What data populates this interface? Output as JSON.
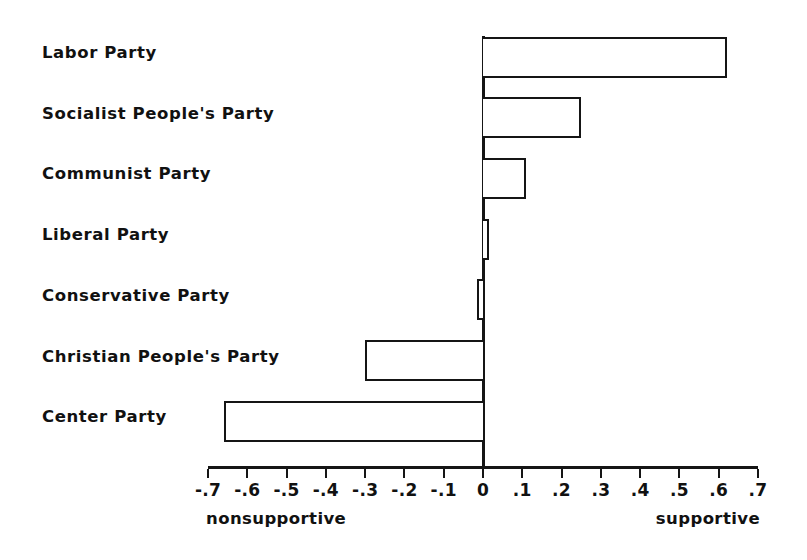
{
  "chart_data": {
    "type": "bar",
    "orientation": "horizontal",
    "title": "",
    "subtitle": "",
    "xlabel": "",
    "ylabel": "",
    "grid": false,
    "legend": null,
    "xlim": [
      -0.7,
      0.7
    ],
    "categories": [
      "Labor Party",
      "Socialist People's Party",
      "Communist Party",
      "Liberal Party",
      "Conservative Party",
      "Christian People's Party",
      "Center Party"
    ],
    "values": [
      0.62,
      0.25,
      0.11,
      0.015,
      -0.015,
      -0.3,
      -0.66
    ],
    "tick_values": [
      -0.7,
      -0.6,
      -0.5,
      -0.4,
      -0.3,
      -0.2,
      -0.1,
      0,
      0.1,
      0.2,
      0.3,
      0.4,
      0.5,
      0.6,
      0.7
    ],
    "tick_labels": [
      "-.7",
      "-.6",
      "-.5",
      "-.4",
      "-.3",
      "-.2",
      "-.1",
      "0",
      ".1",
      ".2",
      ".3",
      ".4",
      ".5",
      ".6",
      ".7"
    ],
    "axis_end_labels": {
      "left": "nonsupportive",
      "right": "supportive"
    },
    "colors": {
      "bar_fill": "#ffffff",
      "bar_stroke": "#151515",
      "axis": "#151515",
      "text": "#111111",
      "background": "#ffffff"
    }
  }
}
